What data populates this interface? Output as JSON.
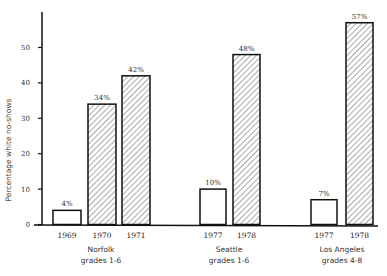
{
  "chart_data": {
    "type": "bar",
    "title": "",
    "xlabel": "",
    "ylabel": "Percentage white no-shows",
    "ylim": [
      0,
      60
    ],
    "yticks": [
      0,
      10,
      20,
      30,
      40,
      50
    ],
    "grid": false,
    "legend": null,
    "groups": [
      {
        "name": "Norfolk grades 1-6",
        "line1": "Norfolk",
        "line2": "grades 1-6",
        "bars": [
          {
            "year": "1969",
            "value": 4,
            "label": "4%",
            "style": "open"
          },
          {
            "year": "1970",
            "value": 34,
            "label": "34%",
            "style": "hatched"
          },
          {
            "year": "1971",
            "value": 42,
            "label": "42%",
            "style": "hatched"
          }
        ]
      },
      {
        "name": "Seattle grades 1-6",
        "line1": "Seattle",
        "line2": "grades 1-6",
        "bars": [
          {
            "year": "1977",
            "value": 10,
            "label": "10%",
            "style": "open"
          },
          {
            "year": "1978",
            "value": 48,
            "label": "48%",
            "style": "hatched"
          }
        ]
      },
      {
        "name": "Los Angeles grades 4-8",
        "line1": "Los Angeles",
        "line2": "grades 4-8",
        "bars": [
          {
            "year": "1977",
            "value": 7,
            "label": "7%",
            "style": "open"
          },
          {
            "year": "1978",
            "value": 57,
            "label": "57%",
            "style": "hatched"
          }
        ]
      }
    ],
    "categories": [
      "Norfolk 1969",
      "Norfolk 1970",
      "Norfolk 1971",
      "Seattle 1977",
      "Seattle 1978",
      "Los Angeles 1977",
      "Los Angeles 1978"
    ],
    "values": [
      4,
      34,
      42,
      10,
      48,
      7,
      57
    ]
  },
  "caption": "2. Nonfr..."
}
